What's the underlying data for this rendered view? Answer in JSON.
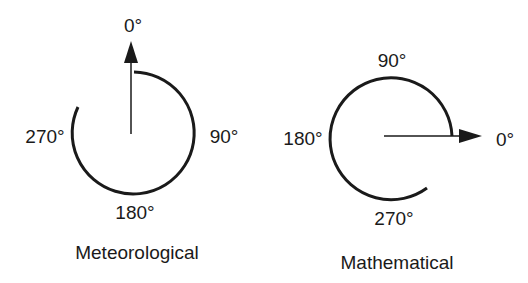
{
  "diagrams": [
    {
      "title": "Meteorological",
      "labels": {
        "top": "0°",
        "right": "90°",
        "bottom": "180°",
        "left": "270°"
      },
      "direction": "clockwise from north"
    },
    {
      "title": "Mathematical",
      "labels": {
        "top": "90°",
        "right": "0°",
        "bottom": "270°",
        "left": "180°"
      },
      "direction": "counterclockwise from east"
    }
  ],
  "colors": {
    "stroke": "#1a1a1a",
    "background": "#ffffff"
  }
}
